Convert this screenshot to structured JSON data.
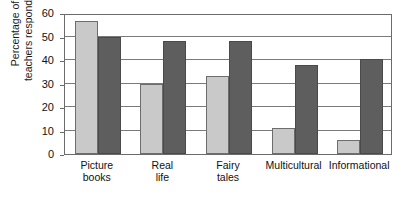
{
  "chart_data": {
    "type": "bar",
    "title": "",
    "subtitle": "",
    "xlabel": "",
    "ylabel": "Percentage of teachers responding",
    "ylabel_lines": [
      "Percentage of",
      "teachers responding"
    ],
    "ylim": [
      0,
      60
    ],
    "ytick_step": 10,
    "yticks": [
      0,
      10,
      20,
      30,
      40,
      50,
      60
    ],
    "ytick_labels": [
      "0",
      "10",
      "20",
      "30",
      "40",
      "50",
      "60"
    ],
    "grid": true,
    "grid_orientation": "horizontal",
    "legend": false,
    "legend_position": "none",
    "annotations": [],
    "categories": [
      "Picture books",
      "Real life",
      "Fairy tales",
      "Multicultural",
      "Informational"
    ],
    "category_label_lines": [
      [
        "Picture",
        "books"
      ],
      [
        "Real",
        "life"
      ],
      [
        "Fairy",
        "tales"
      ],
      [
        "Multicultural"
      ],
      [
        "Informational"
      ]
    ],
    "series": [
      {
        "name": "light-series",
        "color": "#c9c9c9",
        "values": [
          56.5,
          30,
          33,
          11,
          6
        ]
      },
      {
        "name": "dark-series",
        "color": "#5e5e5e",
        "values": [
          50,
          48,
          48,
          38,
          40.5
        ]
      }
    ]
  },
  "colors": {
    "light_bar": "#c9c9c9",
    "dark_bar": "#5e5e5e",
    "axis": "#6b6b6b",
    "grid": "#7a7a7a",
    "text": "#111111",
    "background": "#ffffff"
  }
}
